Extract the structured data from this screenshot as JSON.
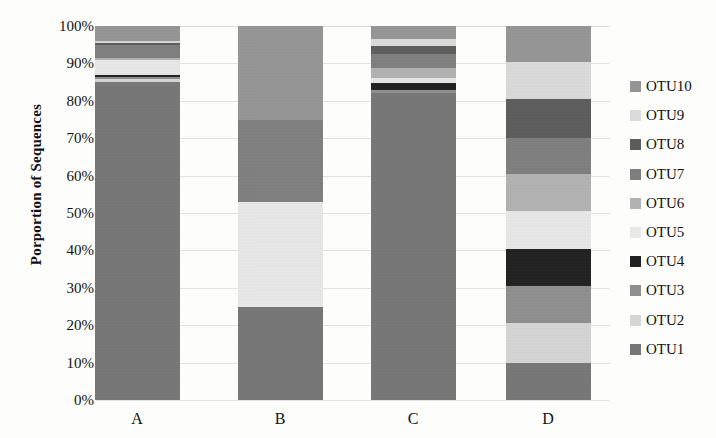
{
  "chart_data": {
    "type": "bar",
    "subtype": "stacked-bar-100-percent",
    "title": "",
    "xlabel": "",
    "ylabel": "Porportion of Sequences",
    "ylim": [
      0,
      100
    ],
    "grid": true,
    "legend_position": "right",
    "categories": [
      "A",
      "B",
      "C",
      "D"
    ],
    "ytick_labels": [
      "100%",
      "90%",
      "80%",
      "70%",
      "60%",
      "50%",
      "40%",
      "30%",
      "20%",
      "10%",
      "0%"
    ],
    "ytick_values": [
      100,
      90,
      80,
      70,
      60,
      50,
      40,
      30,
      20,
      10,
      0
    ],
    "series": [
      {
        "name": "OTU1",
        "color": "#767676",
        "values": [
          85.0,
          25.0,
          82.0,
          10.0
        ]
      },
      {
        "name": "OTU2",
        "color": "#d9d9d9",
        "values": [
          0.8,
          0.0,
          0.0,
          10.5
        ]
      },
      {
        "name": "OTU3",
        "color": "#8f8f8f",
        "values": [
          0.7,
          0.0,
          0.8,
          10.0
        ]
      },
      {
        "name": "OTU4",
        "color": "#1c1c1c",
        "values": [
          0.5,
          0.0,
          2.0,
          10.0
        ]
      },
      {
        "name": "OTU5",
        "color": "#ececec",
        "values": [
          3.8,
          28.0,
          1.4,
          10.0
        ]
      },
      {
        "name": "OTU6",
        "color": "#b4b4b4",
        "values": [
          0.6,
          0.0,
          2.6,
          10.0
        ]
      },
      {
        "name": "OTU7",
        "color": "#7e7e7e",
        "values": [
          3.6,
          22.0,
          3.6,
          9.5
        ]
      },
      {
        "name": "OTU8",
        "color": "#5a5a5a",
        "values": [
          0.5,
          0.0,
          2.4,
          10.5
        ]
      },
      {
        "name": "OTU9",
        "color": "#dedede",
        "values": [
          0.5,
          0.0,
          1.8,
          10.0
        ]
      },
      {
        "name": "OTU10",
        "color": "#969696",
        "values": [
          4.0,
          25.0,
          3.4,
          9.5
        ]
      }
    ],
    "legend_entries": [
      {
        "label": "OTU10",
        "color": "#969696"
      },
      {
        "label": "OTU9",
        "color": "#dedede"
      },
      {
        "label": "OTU8",
        "color": "#5a5a5a"
      },
      {
        "label": "OTU7",
        "color": "#7e7e7e"
      },
      {
        "label": "OTU6",
        "color": "#b4b4b4"
      },
      {
        "label": "OTU5",
        "color": "#ececec"
      },
      {
        "label": "OTU4",
        "color": "#1c1c1c"
      },
      {
        "label": "OTU3",
        "color": "#8f8f8f"
      },
      {
        "label": "OTU2",
        "color": "#d9d9d9"
      },
      {
        "label": "OTU1",
        "color": "#767676"
      }
    ]
  }
}
